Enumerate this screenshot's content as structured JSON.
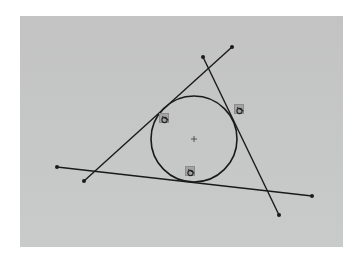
{
  "viewport": {
    "background": "#ffffff",
    "canvas_color": "#c5c6c6",
    "line_color": "#1a1a1a"
  },
  "sketch": {
    "lines": [
      {
        "id": "line-1",
        "x1": 84,
        "y1": 181,
        "x2": 232,
        "y2": 47
      },
      {
        "id": "line-2",
        "x1": 203,
        "y1": 57,
        "x2": 279,
        "y2": 215
      },
      {
        "id": "line-3",
        "x1": 57,
        "y1": 167,
        "x2": 312,
        "y2": 196
      }
    ],
    "circle": {
      "cx": 194,
      "cy": 139,
      "r": 43
    },
    "center_mark": "+",
    "relations": [
      {
        "type": "tangent",
        "icon": "tangent-icon",
        "x": 159,
        "y": 113
      },
      {
        "type": "tangent",
        "icon": "tangent-icon",
        "x": 234,
        "y": 104
      },
      {
        "type": "tangent",
        "icon": "tangent-icon",
        "x": 185,
        "y": 166
      }
    ]
  }
}
